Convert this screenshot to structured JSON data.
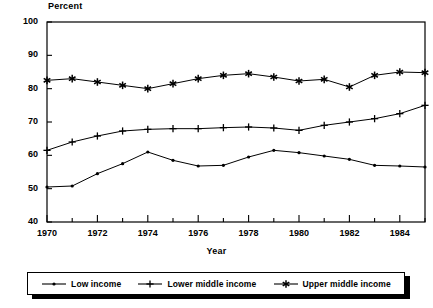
{
  "chart_data": {
    "type": "line",
    "title": "",
    "ylabel": "Percent",
    "xlabel": "Year",
    "ylim": [
      40,
      100
    ],
    "ytick_labels": [
      "40",
      "50",
      "60",
      "70",
      "80",
      "90",
      "100"
    ],
    "ytick_values": [
      40,
      50,
      60,
      70,
      80,
      90,
      100
    ],
    "xlim": [
      1970,
      1985
    ],
    "xtick_labels": [
      "1970",
      "1972",
      "1974",
      "1976",
      "1978",
      "1980",
      "1982",
      "1984"
    ],
    "xtick_values": [
      1970,
      1972,
      1974,
      1976,
      1978,
      1980,
      1982,
      1984
    ],
    "minor_xticks": [
      1971,
      1973,
      1975,
      1977,
      1979,
      1981,
      1983,
      1985
    ],
    "grid": false,
    "legend_position": "bottom",
    "x": [
      1970,
      1971,
      1972,
      1973,
      1974,
      1975,
      1976,
      1977,
      1978,
      1979,
      1980,
      1981,
      1982,
      1983,
      1984,
      1985
    ],
    "series": [
      {
        "name": "Low income",
        "marker": "dot",
        "values": [
          50.5,
          50.8,
          54.5,
          57.5,
          61.0,
          58.5,
          56.8,
          57.0,
          59.5,
          61.5,
          60.8,
          59.8,
          58.8,
          57.0,
          56.8,
          56.5
        ]
      },
      {
        "name": "Lower middle income",
        "marker": "plus",
        "values": [
          61.5,
          64.0,
          65.8,
          67.3,
          67.8,
          68.0,
          68.0,
          68.3,
          68.5,
          68.2,
          67.5,
          69.0,
          70.0,
          71.0,
          72.5,
          75.0
        ]
      },
      {
        "name": "Upper middle income",
        "marker": "asterisk",
        "values": [
          82.5,
          83.0,
          82.0,
          81.0,
          80.0,
          81.5,
          83.0,
          84.0,
          84.5,
          83.5,
          82.3,
          82.8,
          80.5,
          84.0,
          85.0,
          84.8
        ]
      }
    ]
  },
  "legend": {
    "entries": [
      {
        "label": "Low income",
        "marker": "dot"
      },
      {
        "label": "Lower middle income",
        "marker": "plus"
      },
      {
        "label": "Upper middle income",
        "marker": "asterisk"
      }
    ]
  },
  "colors": {
    "line": "#000000",
    "axis": "#000000",
    "background": "#ffffff"
  }
}
